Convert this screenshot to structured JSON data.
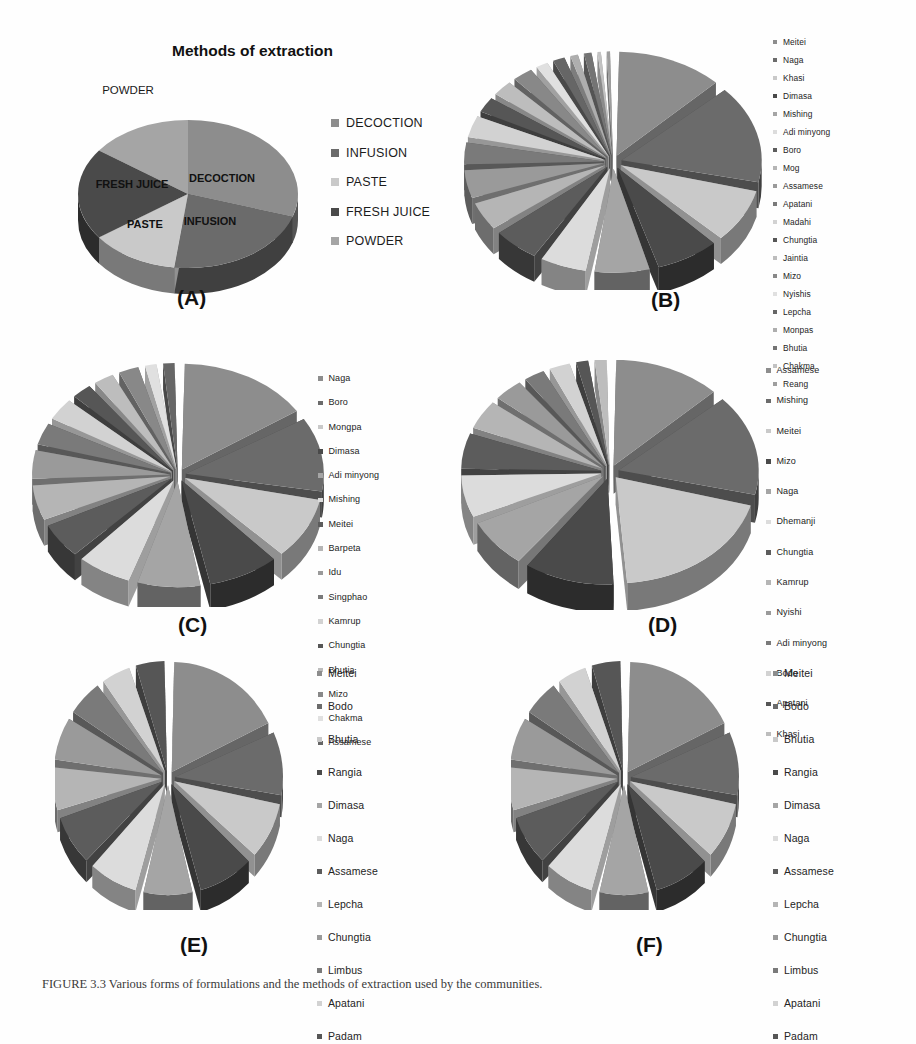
{
  "figure": {
    "caption": "FIGURE 3.3   Various forms of formulations and the methods of extraction used by the communities."
  },
  "palette": {
    "shade1": "#8d8d8d",
    "shade2": "#6b6b6b",
    "shade3": "#c9c9c9",
    "shade4": "#4a4a4a",
    "shade5": "#a5a5a5",
    "shade6": "#dcdcdc",
    "shade7": "#5c5c5c",
    "shade8": "#b5b5b5",
    "background": "#fefefe",
    "text": "#1a1a1a"
  },
  "panels": [
    {
      "id": "A",
      "label": "(A)",
      "title": "Methods of extraction",
      "outside_labels": [
        "POWDER"
      ],
      "inside_labels": [
        "DECOCTION",
        "INFUSION",
        "PASTE",
        "FRESH JUICE"
      ],
      "legend": [
        "DECOCTION",
        "INFUSION",
        "PASTE",
        "FRESH JUICE",
        "POWDER"
      ],
      "chart_data": {
        "type": "pie",
        "title": "Methods of extraction",
        "categories": [
          "DECOCTION",
          "INFUSION",
          "PASTE",
          "FRESH JUICE",
          "POWDER"
        ],
        "values": [
          30,
          22,
          13,
          20,
          15
        ],
        "exploded": false,
        "three_d": true,
        "legend_position": "right"
      }
    },
    {
      "id": "B",
      "label": "(B)",
      "title": "",
      "legend": [
        "Meitei",
        "Naga",
        "Khasi",
        "Dimasa",
        "Mishing",
        "Adi minyong",
        "Boro",
        "Mog",
        "Assamese",
        "Apatani",
        "Madahi",
        "Chungtia",
        "Jaintia",
        "Mizo",
        "Nyishis",
        "Lepcha",
        "Monpas",
        "Bhutia",
        "Chakma",
        "Reang"
      ],
      "chart_data": {
        "type": "pie",
        "title": "",
        "categories": [
          "Meitei",
          "Naga",
          "Khasi",
          "Dimasa",
          "Mishing",
          "Adi minyong",
          "Boro",
          "Mog",
          "Assamese",
          "Apatani",
          "Madahi",
          "Chungtia",
          "Jaintia",
          "Mizo",
          "Nyishis",
          "Lepcha",
          "Monpas",
          "Bhutia",
          "Chakma",
          "Reang"
        ],
        "values": [
          13,
          16,
          9,
          8,
          7,
          6,
          6,
          5,
          5,
          4,
          4,
          3,
          3,
          3,
          2,
          2,
          1.5,
          1.5,
          1,
          1
        ],
        "exploded": true,
        "three_d": true,
        "legend_position": "right"
      }
    },
    {
      "id": "C",
      "label": "(C)",
      "title": "",
      "legend": [
        "Naga",
        "Boro",
        "Mongpa",
        "Dimasa",
        "Adi minyong",
        "Mishing",
        "Meitei",
        "Barpeta",
        "Idu",
        "Singphao",
        "Kamrup",
        "Chungtia",
        "Bhutia",
        "Mizo",
        "Chakma",
        "Assamese"
      ],
      "chart_data": {
        "type": "pie",
        "title": "",
        "categories": [
          "Naga",
          "Boro",
          "Mongpa",
          "Dimasa",
          "Adi minyong",
          "Mishing",
          "Meitei",
          "Barpeta",
          "Idu",
          "Singphao",
          "Kamrup",
          "Chungtia",
          "Bhutia",
          "Mizo",
          "Chakma",
          "Assamese"
        ],
        "values": [
          16,
          12,
          10,
          9,
          8,
          7,
          6,
          6,
          5,
          4,
          4,
          3,
          3,
          3,
          2,
          2
        ],
        "exploded": true,
        "three_d": true,
        "legend_position": "right"
      }
    },
    {
      "id": "D",
      "label": "(D)",
      "title": "",
      "legend": [
        "Assamese",
        "Mishing",
        "Meitei",
        "Mizo",
        "Naga",
        "Dhemanji",
        "Chungtia",
        "Kamrup",
        "Nyishi",
        "Adi minyong",
        "Bodo",
        "Apatani",
        "Khasi"
      ],
      "chart_data": {
        "type": "pie",
        "title": "",
        "categories": [
          "Assamese",
          "Mishing",
          "Meitei",
          "Mizo",
          "Naga",
          "Dhemanji",
          "Chungtia",
          "Kamrup",
          "Nyishi",
          "Adi minyong",
          "Bodo",
          "Apatani",
          "Khasi"
        ],
        "values": [
          13,
          16,
          20,
          11,
          8,
          7,
          6,
          5,
          4,
          3,
          3,
          2,
          2
        ],
        "exploded": true,
        "three_d": true,
        "legend_position": "right"
      }
    },
    {
      "id": "E",
      "label": "(E)",
      "title": "",
      "legend": [
        "Meitei",
        "Bodo",
        "Bhutia",
        "Rangia",
        "Dimasa",
        "Naga",
        "Assamese",
        "Lepcha",
        "Chungtia",
        "Limbus",
        "Apatani",
        "Padam"
      ],
      "chart_data": {
        "type": "pie",
        "title": "",
        "categories": [
          "Meitei",
          "Bodo",
          "Bhutia",
          "Rangia",
          "Dimasa",
          "Naga",
          "Assamese",
          "Lepcha",
          "Chungtia",
          "Limbus",
          "Apatani",
          "Padam"
        ],
        "values": [
          18,
          10,
          9,
          9,
          8,
          8,
          8,
          7,
          7,
          6,
          5,
          5
        ],
        "exploded": true,
        "three_d": true,
        "legend_position": "right"
      }
    },
    {
      "id": "F",
      "label": "(F)",
      "title": "",
      "legend": [
        "Meitei",
        "Bodo",
        "Bhutia",
        "Rangia",
        "Dimasa",
        "Naga",
        "Assamese",
        "Lepcha",
        "Chungtia",
        "Limbus",
        "Apatani",
        "Padam"
      ],
      "chart_data": {
        "type": "pie",
        "title": "",
        "categories": [
          "Meitei",
          "Bodo",
          "Bhutia",
          "Rangia",
          "Dimasa",
          "Naga",
          "Assamese",
          "Lepcha",
          "Chungtia",
          "Limbus",
          "Apatani",
          "Padam"
        ],
        "values": [
          18,
          10,
          9,
          9,
          8,
          8,
          8,
          7,
          7,
          6,
          5,
          5
        ],
        "exploded": true,
        "three_d": true,
        "legend_position": "right"
      }
    }
  ]
}
